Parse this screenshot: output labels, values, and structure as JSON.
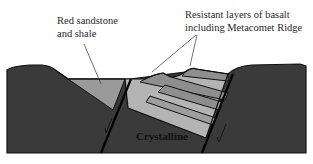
{
  "diagram": {
    "type": "geologic-cross-section",
    "labels": {
      "sandstone_line1": "Red sandstone",
      "sandstone_line2": "and shale",
      "basalt_line1": "Resistant layers of basalt",
      "basalt_line2": "including Metacomet Ridge",
      "basement": "Crystalline"
    },
    "colors": {
      "crystalline": "#3a3a3a",
      "sandstone": "#9a9a9a",
      "basalt_light": "#b4b4b4",
      "basalt_mid": "#8e8e8e",
      "outline": "#111111",
      "background": "#ffffff"
    },
    "features": {
      "faults": [
        "left-normal-fault",
        "right-normal-fault"
      ],
      "motion_arrows": [
        "down-left",
        "down-right"
      ],
      "tilted_layers": 5
    }
  }
}
